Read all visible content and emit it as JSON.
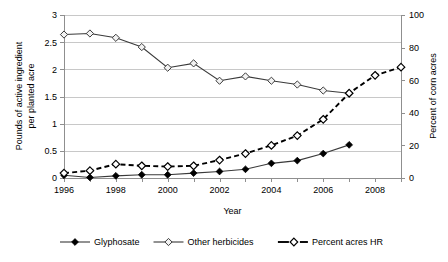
{
  "chart_data": {
    "type": "line",
    "title": "",
    "xlabel": "Year",
    "ylabel": "Pounds of active ingredient per planted acre",
    "ylabel_line1": "Pounds of active ingredient",
    "ylabel_line2": "per planted acre",
    "y2label": "Percent of corn acres",
    "x": [
      1996,
      1997,
      1998,
      1999,
      2000,
      2001,
      2002,
      2003,
      2004,
      2005,
      2006,
      2007,
      2008,
      2009
    ],
    "xlim": [
      1996,
      2009
    ],
    "ylim": [
      0,
      3
    ],
    "y2lim": [
      0,
      100
    ],
    "xticks": [
      1996,
      1998,
      2000,
      2002,
      2004,
      2006,
      2008
    ],
    "xtick_labels": [
      "1996",
      "1998",
      "2000",
      "2002",
      "2004",
      "2006",
      "2008"
    ],
    "yticks": [
      0,
      0.5,
      1,
      1.5,
      2,
      2.5,
      3
    ],
    "ytick_labels": [
      "0",
      "0.5",
      "1",
      "1.5",
      "2",
      "2.5",
      "3"
    ],
    "y2ticks": [
      0,
      20,
      40,
      60,
      80,
      100
    ],
    "y2tick_labels": [
      "0",
      "20",
      "40",
      "60",
      "80",
      "100"
    ],
    "grid": true,
    "legend_position": "bottom",
    "series": [
      {
        "name": "Glyphosate",
        "axis": "left",
        "linestyle": "solid",
        "marker": "filled-diamond",
        "x": [
          1996,
          1997,
          1998,
          1999,
          2000,
          2001,
          2002,
          2003,
          2004,
          2005,
          2006,
          2007
        ],
        "values": [
          0.05,
          0.01,
          0.04,
          0.06,
          0.06,
          0.09,
          0.12,
          0.16,
          0.27,
          0.32,
          0.45,
          0.61
        ]
      },
      {
        "name": "Other herbicides",
        "axis": "left",
        "linestyle": "solid",
        "marker": "open-diamond",
        "x": [
          1996,
          1997,
          1998,
          1999,
          2000,
          2001,
          2002,
          2003,
          2004,
          2005,
          2006,
          2007
        ],
        "values": [
          2.64,
          2.66,
          2.58,
          2.41,
          2.03,
          2.11,
          1.79,
          1.87,
          1.79,
          1.72,
          1.61,
          1.56
        ]
      },
      {
        "name": "Percent acres HR",
        "axis": "right",
        "linestyle": "dashed",
        "marker": "open-diamond",
        "x": [
          1996,
          1997,
          1998,
          1999,
          2000,
          2001,
          2002,
          2003,
          2004,
          2005,
          2006,
          2007,
          2008,
          2009
        ],
        "values": [
          3,
          4.5,
          8.5,
          7.5,
          7,
          7.5,
          11,
          15,
          20,
          26,
          36,
          52,
          63,
          68
        ]
      }
    ],
    "legend": [
      {
        "label": "Glyphosate",
        "marker": "filled-diamond",
        "linestyle": "solid"
      },
      {
        "label": "Other herbicides",
        "marker": "open-diamond",
        "linestyle": "solid"
      },
      {
        "label": "Percent acres HR",
        "marker": "open-diamond",
        "linestyle": "dashed"
      }
    ],
    "colors": {
      "line": "#3a3a3a",
      "dashed_line": "#000000",
      "grid": "#c8c8c8",
      "axis": "#8f8f8f",
      "text": "#000000",
      "background": "#ffffff"
    }
  }
}
